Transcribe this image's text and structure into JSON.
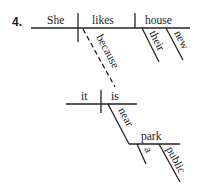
{
  "diagram": {
    "type": "sentence-diagram",
    "number": "4.",
    "main_clause": {
      "subject": "She",
      "verb": "likes",
      "object": "house",
      "object_modifiers": [
        "their",
        "new"
      ],
      "connector": "because"
    },
    "sub_clause": {
      "subject": "it",
      "verb": "is",
      "preposition": "near",
      "prep_object": "park",
      "prep_object_modifiers": [
        "a",
        "public"
      ]
    }
  }
}
